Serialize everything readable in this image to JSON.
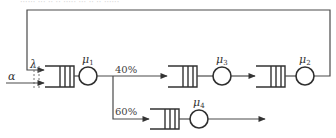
{
  "diagram": {
    "type": "queueing-network",
    "top_cutoff_text": "······ ··· ·· ·· ····· ··· ·· ·· ······",
    "input": {
      "label": "α"
    },
    "feedback": {
      "label": "λ"
    },
    "nodes": [
      {
        "id": "q1",
        "server": "μ",
        "sub": "1"
      },
      {
        "id": "q3",
        "server": "μ",
        "sub": "3"
      },
      {
        "id": "q2",
        "server": "μ",
        "sub": "2"
      },
      {
        "id": "q4",
        "server": "μ",
        "sub": "4"
      }
    ],
    "branches": [
      {
        "from": "q1",
        "to": "q3",
        "label": "40%"
      },
      {
        "from": "q1",
        "to": "q4",
        "label": "60%"
      }
    ],
    "edges": [
      {
        "from": "input",
        "to": "q1"
      },
      {
        "from": "q3",
        "to": "q2"
      },
      {
        "from": "q2",
        "to": "q1",
        "kind": "feedback"
      },
      {
        "from": "q4",
        "to": "exit"
      }
    ],
    "colors": {
      "line": "#4a4a4a",
      "background": "#ffffff"
    }
  }
}
